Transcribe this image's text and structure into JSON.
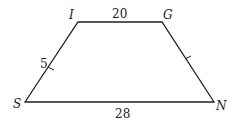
{
  "diagram": {
    "type": "trapezoid",
    "vertices": [
      {
        "name": "I",
        "x": 78,
        "y": 22,
        "label_x": 69,
        "label_y": 19
      },
      {
        "name": "G",
        "x": 162,
        "y": 22,
        "label_x": 163,
        "label_y": 19
      },
      {
        "name": "N",
        "x": 214,
        "y": 102,
        "label_x": 216,
        "label_y": 110
      },
      {
        "name": "S",
        "x": 25,
        "y": 102,
        "label_x": 14,
        "label_y": 108
      }
    ],
    "sides": {
      "IG": {
        "label": "20",
        "x": 119,
        "y": 18
      },
      "SN": {
        "label": "28",
        "x": 122,
        "y": 118
      },
      "SI": {
        "label": "5",
        "x": 44,
        "y": 67
      }
    },
    "congruent_sides": [
      "SI",
      "GN"
    ],
    "stroke_color": "#222222"
  }
}
